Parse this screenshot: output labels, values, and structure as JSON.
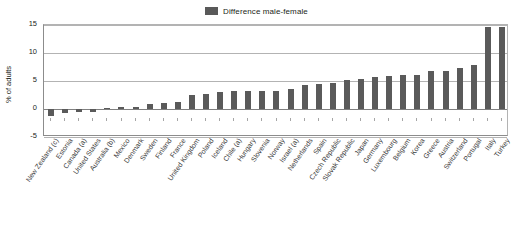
{
  "legend": {
    "label": "Difference male-female",
    "swatch_color": "#595959",
    "position": "top-center"
  },
  "axes": {
    "ylabel": "% of adults",
    "xlabel": "",
    "yticks": [
      15,
      10,
      5,
      0,
      -5
    ],
    "ylim": [
      -5,
      15
    ],
    "grid": true
  },
  "chart_data": {
    "type": "bar",
    "title": "",
    "subtitle": "",
    "xlabel": "",
    "ylabel": "% of adults",
    "ylim": [
      -5,
      15
    ],
    "yticks": [
      15,
      10,
      5,
      0,
      -5
    ],
    "grid": true,
    "legend_position": "top-center",
    "series_name": "Difference male-female",
    "bar_color": "#5a5a5a",
    "categories": [
      "New Zealand (c)",
      "Estonia",
      "Canada (a)",
      "United States",
      "Australia (b)",
      "Mexico",
      "Denmark",
      "Sweden",
      "Finland",
      "France",
      "United Kingdom",
      "Poland",
      "Iceland",
      "Chile (a)",
      "Hungary",
      "Slovenia",
      "Norway",
      "Israel (a)",
      "Netherlands",
      "Spain",
      "Czech Republic",
      "Slovak Republic",
      "Japan",
      "Germany",
      "Luxembourg",
      "Belgium",
      "Korea",
      "Greece",
      "Austria",
      "Switzerland",
      "Portugal",
      "Italy",
      "Turkey"
    ],
    "values": [
      -1.3,
      -0.7,
      -0.5,
      -0.5,
      0.1,
      0.3,
      0.4,
      0.9,
      1.0,
      1.2,
      2.5,
      2.7,
      3.0,
      3.2,
      3.2,
      3.2,
      3.3,
      3.5,
      4.2,
      4.4,
      4.6,
      5.1,
      5.3,
      5.7,
      5.9,
      6.0,
      6.1,
      6.7,
      6.8,
      7.4,
      7.8,
      14.7,
      14.7
    ]
  }
}
